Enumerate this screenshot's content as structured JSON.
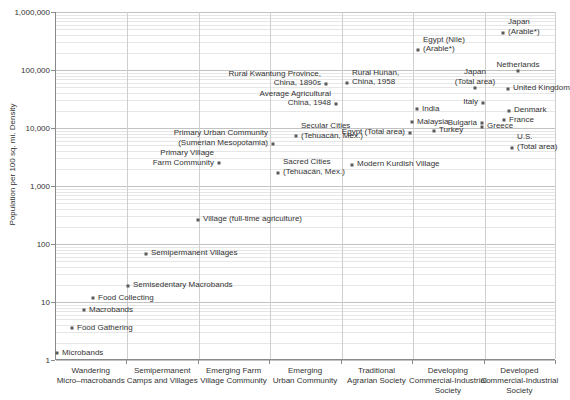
{
  "chart_data": {
    "type": "scatter",
    "title": "",
    "xlabel": "",
    "ylabel": "Population per 100 sq. mi. Density",
    "yscale": "log",
    "ylim": [
      1,
      1000000
    ],
    "ytick_labels": [
      "1,000,000",
      "100,000",
      "10,000",
      "1,000",
      "100",
      "10",
      "1"
    ],
    "ytick_values": [
      1000000,
      100000,
      10000,
      1000,
      100,
      10,
      1
    ],
    "grid": "both",
    "legend": "none",
    "categories": [
      "Wandering\nMicro–macrobands",
      "Semipermanent\nCamps and Villages",
      "Emerging Farm\nVillage Community",
      "Emerging\nUrban Community",
      "Traditional\nAgrarian Society",
      "Developing\nCommercial-Industrial\nSociety",
      "Developed\nCommercial-Industrial\nSociety"
    ],
    "points": [
      {
        "label": "Microbands",
        "category": 0,
        "x": 57,
        "y": 1.3,
        "align": "l"
      },
      {
        "label": "Food Gathering",
        "category": 0,
        "x": 72,
        "y": 3.5,
        "align": "l"
      },
      {
        "label": "Macrobands",
        "category": 0,
        "x": 84,
        "y": 7.2,
        "align": "l"
      },
      {
        "label": "Food Collecting",
        "category": 0,
        "x": 93,
        "y": 11.5,
        "align": "l"
      },
      {
        "label": "Semisedentary Macrobands",
        "category": 1,
        "x": 128,
        "y": 19,
        "align": "l"
      },
      {
        "label": "Semipermanent Villages",
        "category": 1,
        "x": 146,
        "y": 68,
        "align": "l"
      },
      {
        "label": "Village (full-time agriculture)",
        "category": 2,
        "x": 198,
        "y": 260,
        "align": "l"
      },
      {
        "label": "Primary Village\nFarm Community",
        "category": 2,
        "x": 219,
        "y": 2450,
        "align": "r"
      },
      {
        "label": "Sacred Cities\n(Tehuacán, Mex.)",
        "category": 2,
        "x": 278,
        "y": 1700,
        "align": "l"
      },
      {
        "label": "Primary Urban Community\n(Sumerian Mesopotamia)",
        "category": 3,
        "x": 273,
        "y": 5400,
        "align": "r"
      },
      {
        "label": "Secular Cities\n(Tehuacán, Mex.)",
        "category": 3,
        "x": 296,
        "y": 7200,
        "align": "l"
      },
      {
        "label": "Modern Kurdish Village",
        "category": 3,
        "x": 352,
        "y": 2300,
        "align": "l"
      },
      {
        "label": "Rural Kwantung Province,\nChina, 1890s",
        "category": 3,
        "x": 326,
        "y": 57000,
        "align": "r"
      },
      {
        "label": "Average Agricultural\nChina, 1948",
        "category": 3,
        "x": 336,
        "y": 26000,
        "align": "r"
      },
      {
        "label": "Rural Hunan,\nChina, 1958",
        "category": 4,
        "x": 347,
        "y": 60000,
        "align": "l"
      },
      {
        "label": "Egypt (Total area)",
        "category": 4,
        "x": 410,
        "y": 8200,
        "align": "r"
      },
      {
        "label": "India",
        "category": 4,
        "x": 417,
        "y": 21000,
        "align": "l"
      },
      {
        "label": "Malaysia",
        "category": 4,
        "x": 412,
        "y": 12500,
        "align": "l"
      },
      {
        "label": "Turkey",
        "category": 4,
        "x": 434,
        "y": 9000,
        "align": "l"
      },
      {
        "label": "Egypt (Nile)\n(Arable*)",
        "category": 4,
        "x": 418,
        "y": 220000,
        "align": "l"
      },
      {
        "label": "Japan\n(Total area)",
        "category": 5,
        "x": 475,
        "y": 48000,
        "align": "c"
      },
      {
        "label": "Italy",
        "category": 5,
        "x": 483,
        "y": 27000,
        "align": "r"
      },
      {
        "label": "Bulgaria",
        "category": 5,
        "x": 482,
        "y": 12000,
        "align": "r"
      },
      {
        "label": "Greece",
        "category": 5,
        "x": 482,
        "y": 10500,
        "align": "l"
      },
      {
        "label": "Japan\n(Arable*)",
        "category": 5,
        "x": 503,
        "y": 440000,
        "align": "l"
      },
      {
        "label": "Netherlands",
        "category": 6,
        "x": 518,
        "y": 95000,
        "align": "c"
      },
      {
        "label": "United Kingdom",
        "category": 6,
        "x": 508,
        "y": 47000,
        "align": "l"
      },
      {
        "label": "Denmark",
        "category": 6,
        "x": 509,
        "y": 20000,
        "align": "l"
      },
      {
        "label": "France",
        "category": 6,
        "x": 504,
        "y": 13500,
        "align": "l"
      },
      {
        "label": "U.S.\n(Total area)",
        "category": 6,
        "x": 512,
        "y": 4600,
        "align": "l"
      }
    ],
    "footnote": ""
  }
}
